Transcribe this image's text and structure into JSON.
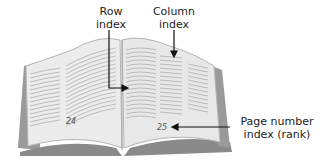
{
  "diagram": {
    "labels": {
      "row_index": [
        "Row",
        "index"
      ],
      "column_index": [
        "Column",
        "index"
      ],
      "page_number": [
        "Page number",
        "index (rank)"
      ]
    },
    "page_numbers": {
      "left": "24",
      "right": "25"
    },
    "colors": {
      "page": "#ececec",
      "page_shadow": "#cfcfcf",
      "cover": "#8a8a8a",
      "lines": "#9a9a9a",
      "arrow": "#111111"
    }
  }
}
